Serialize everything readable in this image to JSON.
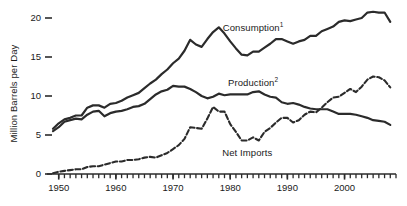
{
  "chart_data": {
    "type": "line",
    "title": "",
    "xlabel": "",
    "ylabel": "Million Barrels per Day",
    "xlim": [
      1949,
      2009
    ],
    "ylim": [
      0,
      21.5
    ],
    "yticks": [
      0,
      5,
      10,
      15,
      20
    ],
    "ytick_labels": [
      "0",
      "5",
      "10",
      "15",
      "20"
    ],
    "xticks": [
      1950,
      1960,
      1970,
      1980,
      1990,
      2000
    ],
    "xtick_labels": [
      "1950",
      "1960",
      "1970",
      "1980",
      "1990",
      "2000"
    ],
    "minor_xtick_interval": 1,
    "grid": false,
    "legend_position": "inline-annotations",
    "line_color": "#2b2b2b",
    "text_color": "#1a1a1a",
    "background": "#ffffff",
    "series": [
      {
        "name": "Consumption",
        "label": "Consumption",
        "footnote_marker": "1",
        "style": "solid",
        "label_x": 1984,
        "label_y": 18.6,
        "x": [
          1949,
          1950,
          1951,
          1952,
          1953,
          1954,
          1955,
          1956,
          1957,
          1958,
          1959,
          1960,
          1961,
          1962,
          1963,
          1964,
          1965,
          1966,
          1967,
          1968,
          1969,
          1970,
          1971,
          1972,
          1973,
          1974,
          1975,
          1976,
          1977,
          1978,
          1979,
          1980,
          1981,
          1982,
          1983,
          1984,
          1985,
          1986,
          1987,
          1988,
          1989,
          1990,
          1991,
          1992,
          1993,
          1994,
          1995,
          1996,
          1997,
          1998,
          1999,
          2000,
          2001,
          2002,
          2003,
          2004,
          2005,
          2006,
          2007,
          2008
        ],
        "y": [
          5.8,
          6.5,
          7.0,
          7.2,
          7.5,
          7.5,
          8.5,
          8.8,
          8.8,
          8.5,
          9.0,
          9.1,
          9.4,
          9.8,
          10.1,
          10.4,
          11.0,
          11.6,
          12.1,
          12.8,
          13.4,
          14.2,
          14.8,
          15.8,
          17.2,
          16.6,
          16.3,
          17.3,
          18.2,
          18.8,
          18.0,
          17.0,
          16.1,
          15.3,
          15.2,
          15.7,
          15.7,
          16.2,
          16.7,
          17.3,
          17.3,
          17.0,
          16.7,
          17.0,
          17.2,
          17.7,
          17.7,
          18.3,
          18.6,
          18.9,
          19.5,
          19.7,
          19.6,
          19.8,
          20.0,
          20.7,
          20.8,
          20.7,
          20.7,
          19.5
        ]
      },
      {
        "name": "Production",
        "label": "Production",
        "footnote_marker": "2",
        "style": "solid",
        "label_x": 1984,
        "label_y": 11.6,
        "x": [
          1949,
          1950,
          1951,
          1952,
          1953,
          1954,
          1955,
          1956,
          1957,
          1958,
          1959,
          1960,
          1961,
          1962,
          1963,
          1964,
          1965,
          1966,
          1967,
          1968,
          1969,
          1970,
          1971,
          1972,
          1973,
          1974,
          1975,
          1976,
          1977,
          1978,
          1979,
          1980,
          1981,
          1982,
          1983,
          1984,
          1985,
          1986,
          1987,
          1988,
          1989,
          1990,
          1991,
          1992,
          1993,
          1994,
          1995,
          1996,
          1997,
          1998,
          1999,
          2000,
          2001,
          2002,
          2003,
          2004,
          2005,
          2006,
          2007,
          2008
        ],
        "y": [
          5.5,
          6.0,
          6.7,
          6.9,
          7.1,
          7.0,
          7.6,
          8.0,
          8.1,
          7.4,
          7.8,
          8.0,
          8.1,
          8.3,
          8.6,
          8.7,
          9.0,
          9.6,
          10.2,
          10.6,
          10.8,
          11.3,
          11.2,
          11.2,
          10.9,
          10.5,
          10.0,
          9.7,
          9.9,
          10.3,
          10.1,
          10.2,
          10.2,
          10.2,
          10.2,
          10.5,
          10.6,
          10.2,
          9.9,
          9.8,
          9.2,
          9.0,
          9.1,
          8.9,
          8.6,
          8.4,
          8.3,
          8.3,
          8.3,
          8.0,
          7.7,
          7.7,
          7.7,
          7.6,
          7.4,
          7.2,
          6.9,
          6.8,
          6.7,
          6.3
        ]
      },
      {
        "name": "Net Imports",
        "label": "Net Imports",
        "footnote_marker": "",
        "style": "dashed",
        "label_x": 1983,
        "label_y": 2.6,
        "x": [
          1949,
          1950,
          1951,
          1952,
          1953,
          1954,
          1955,
          1956,
          1957,
          1958,
          1959,
          1960,
          1961,
          1962,
          1963,
          1964,
          1965,
          1966,
          1967,
          1968,
          1969,
          1970,
          1971,
          1972,
          1973,
          1974,
          1975,
          1976,
          1977,
          1978,
          1979,
          1980,
          1981,
          1982,
          1983,
          1984,
          1985,
          1986,
          1987,
          1988,
          1989,
          1990,
          1991,
          1992,
          1993,
          1994,
          1995,
          1996,
          1997,
          1998,
          1999,
          2000,
          2001,
          2002,
          2003,
          2004,
          2005,
          2006,
          2007,
          2008
        ],
        "y": [
          0.1,
          0.3,
          0.4,
          0.5,
          0.6,
          0.6,
          0.9,
          1.0,
          1.0,
          1.2,
          1.4,
          1.6,
          1.6,
          1.8,
          1.8,
          1.9,
          2.1,
          2.2,
          2.1,
          2.4,
          2.7,
          3.2,
          3.7,
          4.5,
          6.0,
          5.9,
          5.8,
          7.1,
          8.6,
          8.0,
          8.0,
          6.4,
          5.4,
          4.3,
          4.3,
          4.7,
          4.3,
          5.4,
          5.9,
          6.6,
          7.2,
          7.2,
          6.6,
          6.9,
          7.6,
          8.0,
          7.9,
          8.5,
          9.2,
          9.8,
          9.9,
          10.4,
          10.9,
          10.5,
          11.2,
          12.1,
          12.5,
          12.4,
          12.0,
          11.1
        ]
      }
    ]
  },
  "axis": {
    "y_title": "Million Barrels per Day"
  }
}
